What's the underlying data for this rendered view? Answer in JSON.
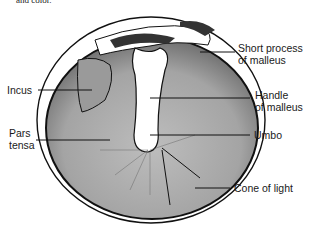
{
  "caption_fragment": "and color.",
  "figure": {
    "labels": {
      "short_process": [
        "Short process",
        "of malleus"
      ],
      "incus": "Incus",
      "handle": [
        "Handle",
        "of malleus"
      ],
      "pars_tensa": [
        "Pars",
        "tensa"
      ],
      "umbo": "Umbo",
      "cone_of_light": "Cone of light"
    }
  },
  "colors": {
    "membrane_fill": "#a9a9a9",
    "outline": "#111111",
    "background": "#ffffff"
  }
}
